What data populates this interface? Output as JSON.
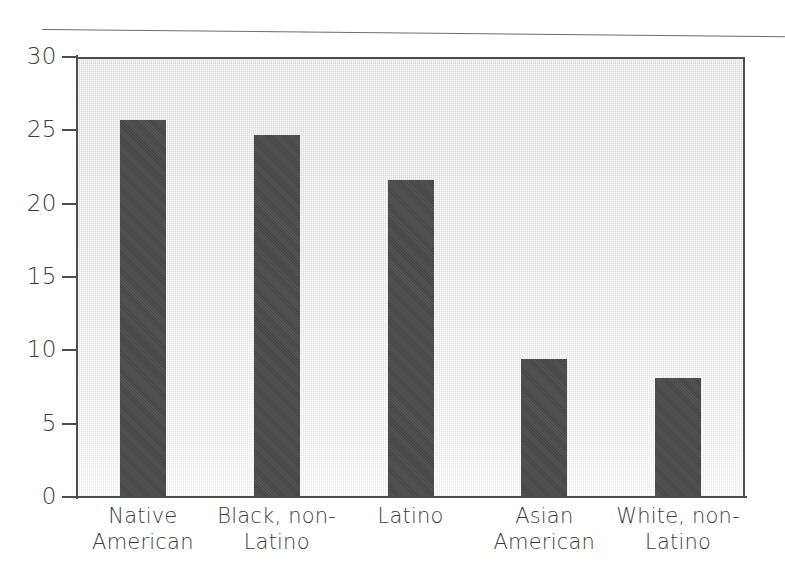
{
  "chart_data": {
    "type": "bar",
    "title": "",
    "subtitle": "",
    "xlabel": "",
    "ylabel": "",
    "categories": [
      "Native American",
      "Black, non-Latino",
      "Latino",
      "Asian American",
      "White, non-Latino"
    ],
    "category_lines": [
      [
        "Native",
        "American"
      ],
      [
        "Black, non-",
        "Latino"
      ],
      [
        "Latino",
        ""
      ],
      [
        "Asian",
        "American"
      ],
      [
        "White, non-",
        "Latino"
      ]
    ],
    "values": [
      25.7,
      24.7,
      21.6,
      9.4,
      8.1
    ],
    "ylim": [
      0,
      30
    ],
    "yticks": [
      0,
      5,
      10,
      15,
      20,
      25,
      30
    ],
    "ytick_labels": [
      "0",
      "5",
      "10",
      "15",
      "20",
      "25",
      "30"
    ],
    "grid": false,
    "legend": null,
    "bar_color": "#4a4a4a",
    "plot_background": "#e9e9e9",
    "axis_color": "#4d4d4d",
    "text_color": "#3c3c3c"
  }
}
